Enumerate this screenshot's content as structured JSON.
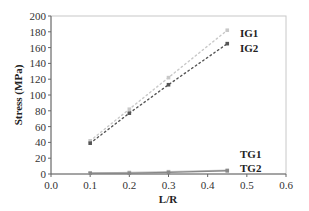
{
  "chart_data": {
    "type": "line",
    "title": "",
    "xlabel": "L/R",
    "ylabel": "Stress (MPa)",
    "xlim": [
      0.0,
      0.6
    ],
    "ylim": [
      0,
      200
    ],
    "xticks": [
      "0.0",
      "0.1",
      "0.2",
      "0.3",
      "0.4",
      "0.5",
      "0.6"
    ],
    "yticks": [
      "0",
      "20",
      "40",
      "60",
      "80",
      "100",
      "120",
      "140",
      "160",
      "180",
      "200"
    ],
    "grid": false,
    "legend_position": "inline labels at line ends",
    "x": [
      0.1,
      0.2,
      0.3,
      0.45
    ],
    "series": [
      {
        "name": "IG1",
        "values": [
          42,
          82,
          122,
          182
        ],
        "color": "#c8c8c8",
        "style": "dotted"
      },
      {
        "name": "IG2",
        "values": [
          39,
          77,
          113,
          165
        ],
        "color": "#555555",
        "style": "dotted"
      },
      {
        "name": "TG1",
        "values": [
          1,
          2,
          3,
          5
        ],
        "color": "#c8c8c8",
        "style": "solid"
      },
      {
        "name": "TG2",
        "values": [
          1,
          1,
          2,
          4
        ],
        "color": "#888888",
        "style": "solid"
      }
    ]
  }
}
